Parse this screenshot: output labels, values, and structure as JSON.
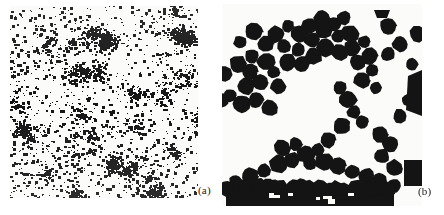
{
  "figure": {
    "width": 444,
    "height": 215,
    "background_color": "#ffffff",
    "ink_color": "#141414",
    "paper_color": "#fbfbfa",
    "panels": [
      {
        "id": "a",
        "label": "(a)",
        "description": "fine random speckle field with clustered aggregates",
        "x": 10,
        "y": 6,
        "width": 188,
        "height": 192,
        "label_x": 198,
        "label_y": 185
      },
      {
        "id": "b",
        "label": "(b)",
        "description": "large dark polygonal discs forming a chain-like aggregate",
        "x": 222,
        "y": 4,
        "width": 200,
        "height": 202,
        "label_x": 418,
        "label_y": 186
      }
    ]
  },
  "chart_data": {
    "type": "scatter",
    "title": "",
    "subtitle": "",
    "xlabel": "",
    "ylabel": "",
    "grid": false,
    "legend": "none",
    "panels": [
      {
        "name": "(a)",
        "marker": "speckle",
        "point_count": 2600,
        "point_size_px": [
          1,
          3
        ],
        "cluster_count": 22,
        "cluster_radius_px": [
          8,
          26
        ],
        "color": "#141414",
        "xlim": [
          0,
          188
        ],
        "ylim": [
          0,
          192
        ]
      },
      {
        "name": "(b)",
        "marker": "disc",
        "disc_diameter_px": [
          13,
          19
        ],
        "color": "#141414",
        "xlim": [
          0,
          200
        ],
        "ylim": [
          0,
          202
        ],
        "discs": [
          [
            18,
            38
          ],
          [
            32,
            28
          ],
          [
            44,
            40
          ],
          [
            30,
            52
          ],
          [
            16,
            60
          ],
          [
            28,
            68
          ],
          [
            44,
            58
          ],
          [
            54,
            30
          ],
          [
            66,
            22
          ],
          [
            78,
            30
          ],
          [
            62,
            42
          ],
          [
            76,
            46
          ],
          [
            90,
            36
          ],
          [
            88,
            22
          ],
          [
            102,
            26
          ],
          [
            100,
            14
          ],
          [
            112,
            20
          ],
          [
            122,
            14
          ],
          [
            116,
            32
          ],
          [
            128,
            30
          ],
          [
            130,
            44
          ],
          [
            118,
            48
          ],
          [
            104,
            44
          ],
          [
            92,
            52
          ],
          [
            80,
            60
          ],
          [
            66,
            58
          ],
          [
            52,
            68
          ],
          [
            38,
            78
          ],
          [
            24,
            82
          ],
          [
            56,
            82
          ],
          [
            142,
            38
          ],
          [
            148,
            52
          ],
          [
            136,
            58
          ],
          [
            150,
            66
          ],
          [
            166,
            22
          ],
          [
            140,
            76
          ],
          [
            154,
            84
          ],
          [
            166,
            50
          ],
          [
            178,
            40
          ],
          [
            118,
            84
          ],
          [
            126,
            96
          ],
          [
            132,
            108
          ],
          [
            140,
            118
          ],
          [
            120,
            122
          ],
          [
            106,
            136
          ],
          [
            96,
            146
          ],
          [
            84,
            150
          ],
          [
            70,
            156
          ],
          [
            56,
            160
          ],
          [
            42,
            166
          ],
          [
            28,
            172
          ],
          [
            14,
            178
          ],
          [
            60,
            144
          ],
          [
            74,
            140
          ],
          [
            88,
            160
          ],
          [
            102,
            158
          ],
          [
            116,
            162
          ],
          [
            130,
            168
          ],
          [
            144,
            172
          ],
          [
            158,
            130
          ],
          [
            168,
            140
          ],
          [
            160,
            152
          ],
          [
            172,
            164
          ],
          [
            158,
            176
          ],
          [
            172,
            182
          ],
          [
            186,
            96
          ],
          [
            178,
            112
          ],
          [
            190,
            60
          ],
          [
            196,
            30
          ],
          [
            8,
            92
          ],
          [
            20,
            100
          ],
          [
            34,
            96
          ],
          [
            48,
            104
          ]
        ],
        "clipped_blob_top": [
          160,
          10
        ],
        "bottom_band": {
          "y": 182,
          "height": 22,
          "x_start": 4,
          "x_end": 172
        }
      }
    ]
  }
}
